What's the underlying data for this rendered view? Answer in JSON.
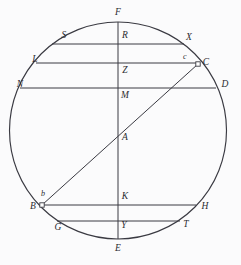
{
  "figure": {
    "background_color": "#fbfbfc",
    "stroke_color": "#3a3a42",
    "label_color": "#2b2b30"
  },
  "circle": {
    "cx": 118,
    "cy": 130.5,
    "r": 108.5
  },
  "vertical_diameter": {
    "name": "F-E",
    "x": 118,
    "y1": 22,
    "y2": 239
  },
  "diagonal": {
    "name": "B-C",
    "x1": 42,
    "y1": 205,
    "x2": 198,
    "y2": 64
  },
  "chords": [
    {
      "name": "S-X",
      "y": 44,
      "x1": 52,
      "x2": 184,
      "left_label": "S",
      "right_label": "X",
      "center_label": "R"
    },
    {
      "name": "L-C",
      "y": 63,
      "x1": 36,
      "x2": 198,
      "left_label": "L",
      "right_label": "C",
      "center_label": "Z"
    },
    {
      "name": "N-D",
      "y": 88,
      "x1": 20,
      "x2": 216,
      "left_label": "N",
      "right_label": "D",
      "center_label": "M"
    },
    {
      "name": "B-H",
      "y": 205,
      "x1": 42,
      "x2": 196,
      "left_label": "B",
      "right_label": "H",
      "center_label": "K"
    },
    {
      "name": "G-T",
      "y": 221,
      "x1": 57,
      "x2": 180,
      "left_label": "G",
      "right_label": "T",
      "center_label": "Y"
    }
  ],
  "points": [
    {
      "id": "F",
      "label": "F",
      "x": 118,
      "y": 13,
      "size": "normal"
    },
    {
      "id": "R",
      "label": "R",
      "x": 125,
      "y": 36,
      "size": "normal"
    },
    {
      "id": "S",
      "label": "S",
      "x": 64,
      "y": 36,
      "size": "normal"
    },
    {
      "id": "X",
      "label": "X",
      "x": 189,
      "y": 38,
      "size": "normal"
    },
    {
      "id": "c",
      "label": "c",
      "x": 185,
      "y": 57,
      "size": "small"
    },
    {
      "id": "C",
      "label": "C",
      "x": 206,
      "y": 63,
      "size": "normal"
    },
    {
      "id": "L",
      "label": "L",
      "x": 35,
      "y": 60,
      "size": "normal"
    },
    {
      "id": "Z",
      "label": "Z",
      "x": 125,
      "y": 71,
      "size": "normal"
    },
    {
      "id": "N",
      "label": "N",
      "x": 20,
      "y": 85,
      "size": "normal"
    },
    {
      "id": "D",
      "label": "D",
      "x": 225,
      "y": 85,
      "size": "normal"
    },
    {
      "id": "M",
      "label": "M",
      "x": 125,
      "y": 96,
      "size": "normal"
    },
    {
      "id": "A",
      "label": "A",
      "x": 125,
      "y": 138,
      "size": "normal"
    },
    {
      "id": "b",
      "label": "b",
      "x": 43,
      "y": 194,
      "size": "small"
    },
    {
      "id": "B",
      "label": "B",
      "x": 33,
      "y": 207,
      "size": "normal"
    },
    {
      "id": "K",
      "label": "K",
      "x": 125,
      "y": 197,
      "size": "normal"
    },
    {
      "id": "H",
      "label": "H",
      "x": 205,
      "y": 207,
      "size": "normal"
    },
    {
      "id": "G",
      "label": "G",
      "x": 58,
      "y": 228,
      "size": "normal"
    },
    {
      "id": "Y",
      "label": "Y",
      "x": 124,
      "y": 226,
      "size": "normal"
    },
    {
      "id": "T",
      "label": "T",
      "x": 186,
      "y": 225,
      "size": "normal"
    },
    {
      "id": "E",
      "label": "E",
      "x": 118,
      "y": 249,
      "size": "normal"
    }
  ],
  "markers": [
    {
      "id": "marker-C",
      "x": 198,
      "y": 64,
      "shape": "square"
    },
    {
      "id": "marker-B",
      "x": 42,
      "y": 205,
      "shape": "square"
    }
  ]
}
